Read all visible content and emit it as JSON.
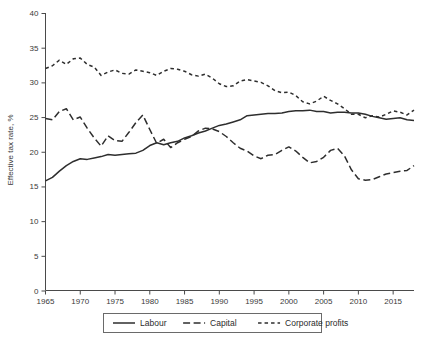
{
  "chart_data": {
    "type": "line",
    "title": "",
    "xlabel": "",
    "ylabel": "Effective tax rate, %",
    "xlim": [
      1965,
      2018
    ],
    "ylim": [
      0,
      40
    ],
    "yticks": [
      0,
      5,
      10,
      15,
      20,
      25,
      30,
      35,
      40
    ],
    "xticks": [
      1965,
      1970,
      1975,
      1980,
      1985,
      1990,
      1995,
      2000,
      2005,
      2010,
      2015
    ],
    "grid": false,
    "legend_position": "bottom-center",
    "x": [
      1965,
      1966,
      1967,
      1968,
      1969,
      1970,
      1971,
      1972,
      1973,
      1974,
      1975,
      1976,
      1977,
      1978,
      1979,
      1980,
      1981,
      1982,
      1983,
      1984,
      1985,
      1986,
      1987,
      1988,
      1989,
      1990,
      1991,
      1992,
      1993,
      1994,
      1995,
      1996,
      1997,
      1998,
      1999,
      2000,
      2001,
      2002,
      2003,
      2004,
      2005,
      2006,
      2007,
      2008,
      2009,
      2010,
      2011,
      2012,
      2013,
      2014,
      2015,
      2016,
      2017,
      2018
    ],
    "series": [
      {
        "name": "Labour",
        "style": "solid",
        "color": "#2e2e2e",
        "values": [
          15.8,
          16.3,
          17.2,
          18.0,
          18.6,
          19.0,
          18.9,
          19.1,
          19.3,
          19.6,
          19.5,
          19.6,
          19.7,
          19.8,
          20.2,
          20.9,
          21.3,
          21.0,
          21.3,
          21.5,
          22.0,
          22.3,
          22.7,
          23.0,
          23.4,
          23.8,
          24.0,
          24.3,
          24.6,
          25.2,
          25.3,
          25.4,
          25.5,
          25.5,
          25.6,
          25.8,
          25.9,
          25.9,
          26.0,
          25.8,
          25.8,
          25.6,
          25.7,
          25.7,
          25.6,
          25.6,
          25.4,
          25.1,
          24.9,
          24.7,
          24.8,
          24.9,
          24.6,
          24.5
        ]
      },
      {
        "name": "Capital",
        "style": "long-dash",
        "color": "#2e2e2e",
        "values": [
          24.8,
          24.6,
          25.8,
          26.2,
          24.6,
          25.0,
          23.4,
          22.0,
          20.8,
          22.3,
          21.6,
          21.5,
          22.8,
          24.2,
          25.3,
          23.2,
          21.2,
          21.8,
          20.6,
          21.3,
          21.8,
          22.2,
          23.0,
          23.4,
          23.3,
          22.9,
          22.2,
          21.3,
          20.5,
          20.1,
          19.4,
          19.0,
          19.5,
          19.6,
          20.2,
          20.7,
          20.1,
          19.2,
          18.4,
          18.6,
          19.2,
          20.2,
          20.5,
          19.4,
          17.4,
          16.1,
          15.9,
          16.0,
          16.4,
          16.8,
          17.0,
          17.2,
          17.3,
          18.0
        ]
      },
      {
        "name": "Corporate profits",
        "style": "short-dash",
        "color": "#2e2e2e",
        "values": [
          32.0,
          32.4,
          33.2,
          32.6,
          33.4,
          33.5,
          32.6,
          32.2,
          31.0,
          31.5,
          31.8,
          31.3,
          31.2,
          31.8,
          31.6,
          31.4,
          31.0,
          31.6,
          32.0,
          31.9,
          31.6,
          31.1,
          30.9,
          31.2,
          30.6,
          29.8,
          29.4,
          29.5,
          30.2,
          30.4,
          30.2,
          30.0,
          29.5,
          28.8,
          28.5,
          28.6,
          28.1,
          27.2,
          26.9,
          27.3,
          28.0,
          27.4,
          26.9,
          26.2,
          25.4,
          25.4,
          24.9,
          25.2,
          25.0,
          25.4,
          25.9,
          25.7,
          25.3,
          26.0
        ]
      }
    ],
    "legend": [
      {
        "label": "Labour",
        "style": "solid"
      },
      {
        "label": "Capital",
        "style": "long-dash"
      },
      {
        "label": "Corporate profits",
        "style": "short-dash"
      }
    ]
  }
}
